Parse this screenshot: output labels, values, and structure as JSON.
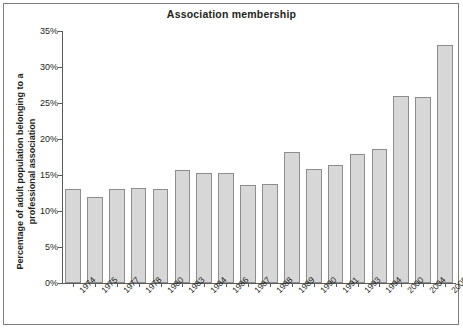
{
  "chart_data": {
    "type": "bar",
    "title": "Association membership",
    "xlabel": "",
    "ylabel": "Percentage of adult population belonging to a professional association",
    "ylim": [
      0,
      35
    ],
    "ytick_labels": [
      "0%",
      "5%",
      "10%",
      "15%",
      "20%",
      "25%",
      "30%",
      "35%"
    ],
    "ytick_values": [
      0,
      5,
      10,
      15,
      20,
      25,
      30,
      35
    ],
    "grid": false,
    "legend": "none",
    "categories": [
      "1974",
      "1975",
      "1977",
      "1978",
      "1980",
      "1983",
      "1984",
      "1986",
      "1987",
      "1988",
      "1989",
      "1990",
      "1991",
      "1993",
      "1994",
      "2000",
      "2004",
      "2005"
    ],
    "values": [
      13,
      12,
      13,
      13.2,
      13,
      15.7,
      15.3,
      15.3,
      13.6,
      13.8,
      18.2,
      15.8,
      16.4,
      17.9,
      18.6,
      26,
      25.9,
      33
    ],
    "bar_color": "#d7d7d7",
    "bar_border_color": "#8d8d8d",
    "axis_color": "#5b5b5b",
    "text_color": "#231f20",
    "background": "#ffffff"
  }
}
